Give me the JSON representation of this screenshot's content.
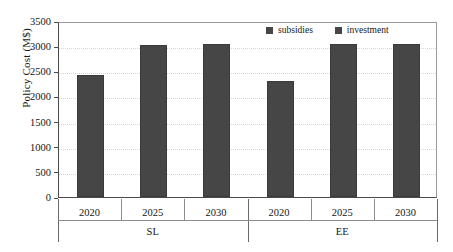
{
  "chart_data": {
    "type": "bar",
    "title": "",
    "xlabel": "",
    "ylabel": "Policy Cost (M$)",
    "ylim": [
      0,
      3500
    ],
    "ytick_labels": [
      "0",
      "500",
      "1000",
      "1500",
      "2000",
      "2500",
      "3000",
      "3500"
    ],
    "ytick_values": [
      0,
      500,
      1000,
      1500,
      2000,
      2500,
      3000,
      3500
    ],
    "grid": true,
    "legend_position": "top-right",
    "categories": [
      "2020",
      "2025",
      "2030",
      "2020",
      "2025",
      "2030"
    ],
    "groups": [
      {
        "label": "SL",
        "categories": [
          "2020",
          "2025",
          "2030"
        ]
      },
      {
        "label": "EE",
        "categories": [
          "2020",
          "2025",
          "2030"
        ]
      }
    ],
    "series": [
      {
        "name": "investment",
        "color": "#464646",
        "values": [
          2420,
          3030,
          3035,
          2310,
          3045,
          3050
        ]
      },
      {
        "name": "subsidies",
        "color": "#464646",
        "values": [
          0,
          0,
          0,
          0,
          0,
          0
        ]
      }
    ],
    "legend": [
      {
        "label": "subsidies",
        "color": "#464646"
      },
      {
        "label": "investment",
        "color": "#464646"
      }
    ],
    "bars": [
      {
        "group": "SL",
        "category": "2020",
        "value": 2420
      },
      {
        "group": "SL",
        "category": "2025",
        "value": 3030
      },
      {
        "group": "SL",
        "category": "2030",
        "value": 3035
      },
      {
        "group": "EE",
        "category": "2020",
        "value": 2310
      },
      {
        "group": "EE",
        "category": "2025",
        "value": 3045
      },
      {
        "group": "EE",
        "category": "2030",
        "value": 3050
      }
    ]
  }
}
